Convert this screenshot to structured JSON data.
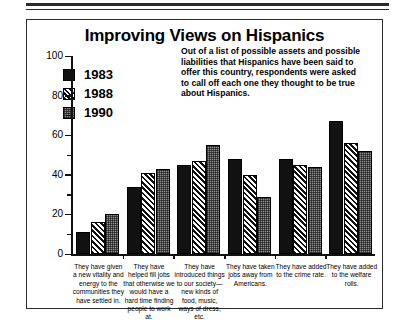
{
  "chart_data": {
    "type": "bar",
    "title": "Improving Views on Hispanics",
    "description": "Out of a list of possible assets and possible liabilities that Hispanics have been said to offer this country, respondents were asked to call off each one they thought to be true about Hispanics.",
    "xlabel": "",
    "ylabel": "",
    "ylim": [
      0,
      100
    ],
    "yticks": [
      0,
      20,
      40,
      60,
      80,
      100
    ],
    "yticks_minor": [
      10,
      30,
      50,
      70,
      90
    ],
    "grid": false,
    "legend_position": "upper-left",
    "categories": [
      "They have given a new vitality and energy to the communities they have settled in.",
      "They have helped fill jobs that otherwise we would have a hard time finding people to work at.",
      "They have introduced things to our society—new kinds of food, music, ways of dress, etc.",
      "They have taken jobs away from Americans.",
      "They have added to the crime rate.",
      "They have added to the welfare rolls."
    ],
    "series": [
      {
        "name": "1983",
        "fill": "solid-black",
        "color": "#111111",
        "values": [
          11,
          34,
          45,
          48,
          48,
          67
        ]
      },
      {
        "name": "1988",
        "fill": "diagonal-hatch",
        "color": "#111111",
        "values": [
          16,
          41,
          47,
          40,
          45,
          56
        ]
      },
      {
        "name": "1990",
        "fill": "checkered-gray",
        "color": "#8f8f8f",
        "values": [
          20,
          43,
          55,
          29,
          44,
          52
        ]
      }
    ]
  }
}
